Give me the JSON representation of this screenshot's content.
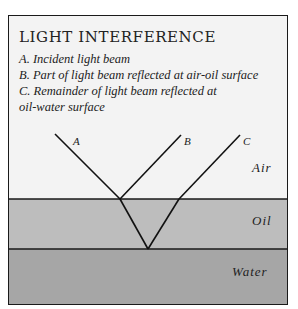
{
  "title": "LIGHT INTERFERENCE",
  "legend": [
    "A. Incident light beam",
    "B. Part of light beam reflected at air-oil surface",
    "C. Remainder of light beam reflected at",
    "oil-water surface"
  ],
  "beam_labels": {
    "a": "A",
    "b": "B",
    "c": "C"
  },
  "layers": {
    "air": {
      "label": "Air",
      "color": "#f3f3f3"
    },
    "oil": {
      "label": "Oil",
      "color": "#bdbdbd"
    },
    "water": {
      "label": "Water",
      "color": "#a6a6a6"
    }
  }
}
